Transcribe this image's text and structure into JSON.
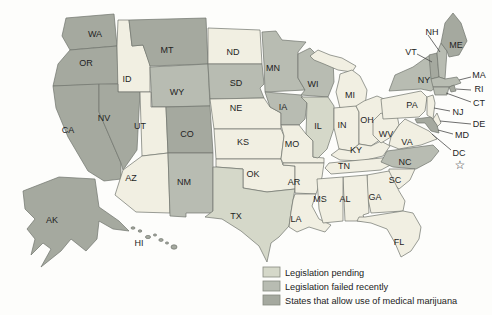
{
  "status_colors": {
    "none": "#f1efe2",
    "pending": "#d5d8c9",
    "failed": "#b8bcb2",
    "allow": "#a5a99f"
  },
  "map": {
    "border_color": "#70746d",
    "background_color": "#fdfdfb"
  },
  "legend": {
    "items": [
      {
        "key": "pending",
        "label": "Legislation pending",
        "color": "#d5d8c9"
      },
      {
        "key": "failed",
        "label": "Legislation failed recently",
        "color": "#b8bcb2"
      },
      {
        "key": "allow",
        "label": "States that allow use of medical marijuana",
        "color": "#a5a99f"
      }
    ]
  },
  "states": {
    "WA": {
      "abbr": "WA",
      "status": "allow"
    },
    "OR": {
      "abbr": "OR",
      "status": "allow"
    },
    "CA": {
      "abbr": "CA",
      "status": "allow"
    },
    "NV": {
      "abbr": "NV",
      "status": "allow"
    },
    "ID": {
      "abbr": "ID",
      "status": "none"
    },
    "MT": {
      "abbr": "MT",
      "status": "allow"
    },
    "WY": {
      "abbr": "WY",
      "status": "failed"
    },
    "UT": {
      "abbr": "UT",
      "status": "none"
    },
    "CO": {
      "abbr": "CO",
      "status": "allow"
    },
    "AZ": {
      "abbr": "AZ",
      "status": "none"
    },
    "NM": {
      "abbr": "NM",
      "status": "failed"
    },
    "ND": {
      "abbr": "ND",
      "status": "none"
    },
    "SD": {
      "abbr": "SD",
      "status": "failed"
    },
    "NE": {
      "abbr": "NE",
      "status": "none"
    },
    "KS": {
      "abbr": "KS",
      "status": "none"
    },
    "OK": {
      "abbr": "OK",
      "status": "none"
    },
    "TX": {
      "abbr": "TX",
      "status": "pending"
    },
    "MN": {
      "abbr": "MN",
      "status": "failed"
    },
    "IA": {
      "abbr": "IA",
      "status": "failed"
    },
    "MO": {
      "abbr": "MO",
      "status": "none"
    },
    "AR": {
      "abbr": "AR",
      "status": "none"
    },
    "LA": {
      "abbr": "LA",
      "status": "none"
    },
    "WI": {
      "abbr": "WI",
      "status": "failed"
    },
    "IL": {
      "abbr": "IL",
      "status": "pending"
    },
    "MI": {
      "abbr": "MI",
      "status": "none"
    },
    "IN": {
      "abbr": "IN",
      "status": "none"
    },
    "OH": {
      "abbr": "OH",
      "status": "none"
    },
    "KY": {
      "abbr": "KY",
      "status": "none"
    },
    "TN": {
      "abbr": "TN",
      "status": "none"
    },
    "MS": {
      "abbr": "MS",
      "status": "none"
    },
    "AL": {
      "abbr": "AL",
      "status": "none"
    },
    "GA": {
      "abbr": "GA",
      "status": "none"
    },
    "FL": {
      "abbr": "FL",
      "status": "none"
    },
    "SC": {
      "abbr": "SC",
      "status": "none"
    },
    "NC": {
      "abbr": "NC",
      "status": "failed"
    },
    "VA": {
      "abbr": "VA",
      "status": "none"
    },
    "WV": {
      "abbr": "WV",
      "status": "none"
    },
    "PA": {
      "abbr": "PA",
      "status": "none"
    },
    "NY": {
      "abbr": "NY",
      "status": "failed"
    },
    "NJ": {
      "abbr": "NJ",
      "status": "none"
    },
    "DE": {
      "abbr": "DE",
      "status": "none"
    },
    "MD": {
      "abbr": "MD",
      "status": "allow"
    },
    "VT": {
      "abbr": "VT",
      "status": "allow"
    },
    "NH": {
      "abbr": "NH",
      "status": "failed"
    },
    "ME": {
      "abbr": "ME",
      "status": "allow"
    },
    "MA": {
      "abbr": "MA",
      "status": "failed"
    },
    "RI": {
      "abbr": "RI",
      "status": "allow"
    },
    "CT": {
      "abbr": "CT",
      "status": "failed"
    },
    "AK": {
      "abbr": "AK",
      "status": "allow"
    },
    "HI": {
      "abbr": "HI",
      "status": "allow"
    },
    "DC": {
      "abbr": "DC",
      "status": "none",
      "star": "☆"
    }
  }
}
